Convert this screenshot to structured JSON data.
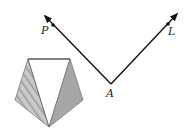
{
  "diagram": {
    "labels": {
      "vertex": "A",
      "ray_left_point": "P",
      "ray_right_point": "L"
    },
    "colors": {
      "line": "#111111",
      "hatched_fill": "#b8b8b8",
      "solid_fill": "#a6a6a6",
      "outline": "#777777"
    },
    "shape": "pentagon divided into three triangles (left hatched, middle white, right shaded)"
  }
}
